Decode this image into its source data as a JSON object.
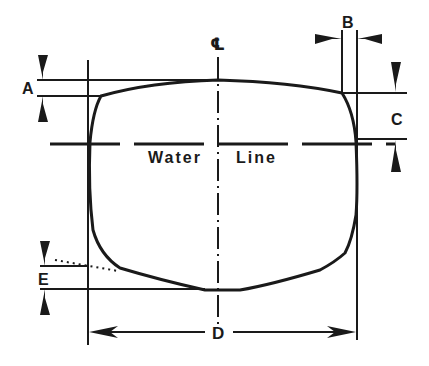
{
  "diagram": {
    "type": "hull cross-section dimension diagram",
    "labels": {
      "centerline": "℄",
      "water_line": "Water Line",
      "water_word": "Water",
      "line_word": "Line",
      "a": "A",
      "b": "B",
      "c": "C",
      "d": "D",
      "e": "E"
    },
    "colors": {
      "ink": "#1a1a1a",
      "background": "#ffffff"
    },
    "dimensions": [
      {
        "id": "A",
        "meaning": "vertical drop from deck crown to deck edge (left side)"
      },
      {
        "id": "B",
        "meaning": "horizontal inset of deck edge from max beam (right side)"
      },
      {
        "id": "C",
        "meaning": "vertical distance from deck edge down to water line (right side)"
      },
      {
        "id": "D",
        "meaning": "overall beam width between side reference lines"
      },
      {
        "id": "E",
        "meaning": "vertical chine/bilge height above keel bottom (left side)"
      }
    ]
  }
}
